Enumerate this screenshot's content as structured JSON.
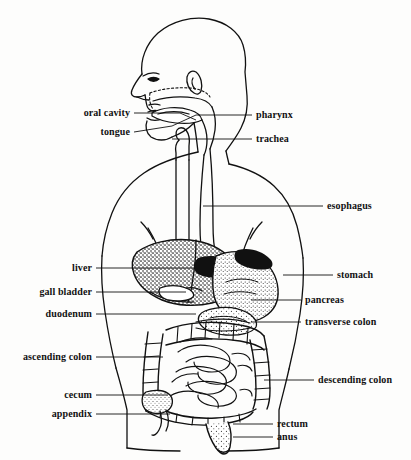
{
  "figure": {
    "line_color": "#111111",
    "background_color": "#fdfdfc"
  },
  "labels_left": [
    {
      "id": "oral-cavity",
      "text": "oral cavity",
      "text_x": 130,
      "text_y": 113,
      "leader": [
        [
          134,
          113
        ],
        [
          180,
          113
        ],
        [
          196,
          120
        ]
      ]
    },
    {
      "id": "tongue",
      "text": "tongue",
      "text_x": 130,
      "text_y": 132,
      "leader": [
        [
          134,
          132
        ],
        [
          172,
          126
        ],
        [
          196,
          115
        ]
      ]
    },
    {
      "id": "liver",
      "text": "liver",
      "text_x": 92,
      "text_y": 268,
      "leader": [
        [
          96,
          268
        ],
        [
          196,
          268
        ]
      ]
    },
    {
      "id": "gall-bladder",
      "text": "gall bladder",
      "text_x": 92,
      "text_y": 292,
      "leader": [
        [
          96,
          292
        ],
        [
          186,
          292
        ]
      ]
    },
    {
      "id": "duodenum",
      "text": "duodenum",
      "text_x": 92,
      "text_y": 314,
      "leader": [
        [
          96,
          314
        ],
        [
          196,
          314
        ]
      ]
    },
    {
      "id": "ascending-colon",
      "text": "ascending colon",
      "text_x": 92,
      "text_y": 357,
      "leader": [
        [
          96,
          357
        ],
        [
          163,
          357
        ]
      ]
    },
    {
      "id": "cecum",
      "text": "cecum",
      "text_x": 92,
      "text_y": 395,
      "leader": [
        [
          96,
          395
        ],
        [
          168,
          395
        ]
      ]
    },
    {
      "id": "appendix",
      "text": "appendix",
      "text_x": 92,
      "text_y": 414,
      "leader": [
        [
          96,
          414
        ],
        [
          170,
          414
        ]
      ]
    }
  ],
  "labels_right": [
    {
      "id": "pharynx",
      "text": "pharynx",
      "text_x": 256,
      "text_y": 115,
      "leader": [
        [
          252,
          115
        ],
        [
          196,
          115
        ]
      ]
    },
    {
      "id": "trachea",
      "text": "trachea",
      "text_x": 256,
      "text_y": 139,
      "leader": [
        [
          252,
          139
        ],
        [
          172,
          139
        ]
      ]
    },
    {
      "id": "esophagus",
      "text": "esophagus",
      "text_x": 327,
      "text_y": 206,
      "leader": [
        [
          323,
          206
        ],
        [
          203,
          206
        ]
      ]
    },
    {
      "id": "stomach",
      "text": "stomach",
      "text_x": 337,
      "text_y": 275,
      "leader": [
        [
          333,
          275
        ],
        [
          283,
          275
        ]
      ]
    },
    {
      "id": "pancreas",
      "text": "pancreas",
      "text_x": 305,
      "text_y": 300,
      "leader": [
        [
          301,
          300
        ],
        [
          251,
          300
        ]
      ]
    },
    {
      "id": "transverse-colon",
      "text": "transverse colon",
      "text_x": 305,
      "text_y": 322,
      "leader": [
        [
          301,
          322
        ],
        [
          251,
          322
        ]
      ]
    },
    {
      "id": "descending-colon",
      "text": "descending colon",
      "text_x": 318,
      "text_y": 380,
      "leader": [
        [
          314,
          380
        ],
        [
          264,
          380
        ]
      ]
    },
    {
      "id": "rectum",
      "text": "rectum",
      "text_x": 277,
      "text_y": 424,
      "leader": [
        [
          273,
          424
        ],
        [
          233,
          424
        ]
      ]
    },
    {
      "id": "anus",
      "text": "anus",
      "text_x": 277,
      "text_y": 437,
      "leader": [
        [
          273,
          437
        ],
        [
          233,
          437
        ]
      ]
    }
  ],
  "organs": [
    {
      "id": "head",
      "name": "head-profile"
    },
    {
      "id": "torso",
      "name": "torso-outline"
    },
    {
      "id": "oral-cavity",
      "name": "oral-cavity"
    },
    {
      "id": "tongue",
      "name": "tongue"
    },
    {
      "id": "pharynx",
      "name": "pharynx"
    },
    {
      "id": "trachea",
      "name": "trachea"
    },
    {
      "id": "esophagus",
      "name": "esophagus"
    },
    {
      "id": "liver",
      "name": "liver"
    },
    {
      "id": "gall-bladder",
      "name": "gall-bladder"
    },
    {
      "id": "stomach",
      "name": "stomach"
    },
    {
      "id": "duodenum",
      "name": "duodenum"
    },
    {
      "id": "pancreas",
      "name": "pancreas"
    },
    {
      "id": "transverse-colon",
      "name": "transverse-colon"
    },
    {
      "id": "ascending-colon",
      "name": "ascending-colon"
    },
    {
      "id": "descending-colon",
      "name": "descending-colon"
    },
    {
      "id": "small-intestine",
      "name": "small-intestine"
    },
    {
      "id": "cecum",
      "name": "cecum"
    },
    {
      "id": "appendix",
      "name": "appendix"
    },
    {
      "id": "rectum",
      "name": "rectum"
    },
    {
      "id": "anus",
      "name": "anus"
    }
  ]
}
